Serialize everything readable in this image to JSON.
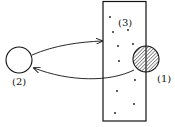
{
  "diagram": {
    "labels": {
      "region1": "(1)",
      "region2": "(2)",
      "region3": "(3)"
    },
    "colors": {
      "stroke": "#111111",
      "background": "#ffffff",
      "hatch": "#555555"
    },
    "elements": {
      "rectangle": {
        "x": 103,
        "y": 1,
        "width": 43,
        "height": 120,
        "description": "container with scattered dots"
      },
      "circle_open": {
        "cx": 19,
        "cy": 60,
        "r": 13,
        "label": "(2)"
      },
      "circle_hatched": {
        "cx": 146,
        "cy": 59,
        "r": 13,
        "label": "(1)"
      }
    },
    "arrows": [
      {
        "from": "(2)",
        "to": "(3)",
        "description": "upper arrow from open circle to rectangle edge"
      },
      {
        "from": "(1)",
        "to": "(2)",
        "description": "lower arrow from hatched circle back to open circle"
      }
    ],
    "dots": [
      [
        110,
        17
      ],
      [
        113,
        32
      ],
      [
        128,
        30
      ],
      [
        118,
        46
      ],
      [
        133,
        44
      ],
      [
        119,
        61
      ],
      [
        135,
        80
      ],
      [
        117,
        91
      ],
      [
        134,
        104
      ],
      [
        115,
        113
      ]
    ]
  }
}
